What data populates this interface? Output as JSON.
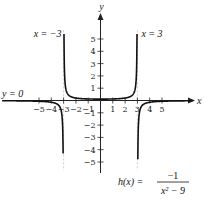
{
  "chart_data": {
    "type": "line",
    "title": "",
    "function_label": "h(x) = -1 / (x^2 - 9)",
    "function_parts": {
      "lhs": "h(x) =",
      "numerator": "−1",
      "denominator": "x² − 9"
    },
    "xlabel": "x",
    "ylabel": "y",
    "xlim": [
      -8,
      7.5
    ],
    "ylim": [
      -5.8,
      7
    ],
    "x_ticks": [
      -5,
      -4,
      -3,
      -2,
      -1,
      1,
      2,
      3,
      4,
      5
    ],
    "x_tick_labels": [
      "−5",
      "−4",
      "−3",
      "−2",
      "−1",
      "1",
      "2",
      "3",
      "4",
      "5"
    ],
    "y_ticks": [
      -5,
      -4,
      -3,
      -2,
      -1,
      1,
      2,
      3,
      4,
      5
    ],
    "y_tick_labels": [
      "−5",
      "−4",
      "−3",
      "−2",
      "−1",
      "1",
      "2",
      "3",
      "4",
      "5"
    ],
    "grid": false,
    "asymptotes": [
      {
        "type": "vertical",
        "value": -3,
        "label": "x = −3"
      },
      {
        "type": "vertical",
        "value": 3,
        "label": "x = 3"
      },
      {
        "type": "horizontal",
        "value": 0,
        "label": "y = 0"
      }
    ],
    "series": [
      {
        "name": "h(x)",
        "formula": "-1/(x^2-9)",
        "domain": [
          -8,
          -3
        ],
        "branch": "left"
      },
      {
        "name": "h(x)",
        "formula": "-1/(x^2-9)",
        "domain": [
          -3,
          3
        ],
        "branch": "middle"
      },
      {
        "name": "h(x)",
        "formula": "-1/(x^2-9)",
        "domain": [
          3,
          7.5
        ],
        "branch": "right"
      }
    ]
  }
}
